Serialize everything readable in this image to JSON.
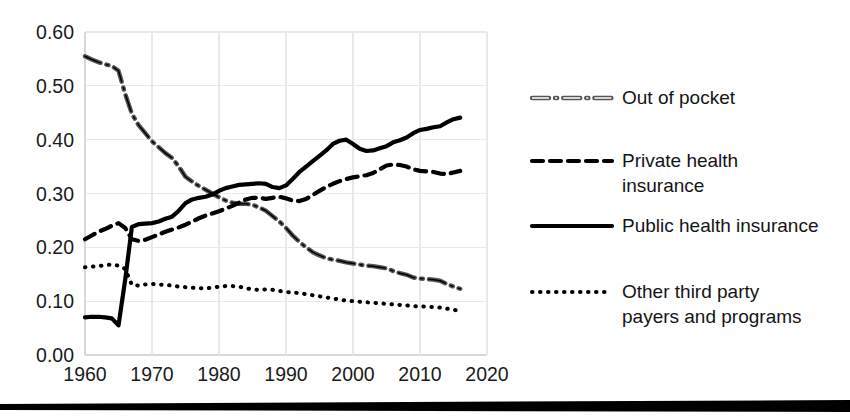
{
  "chart_data": {
    "type": "line",
    "title": "",
    "xlabel": "",
    "ylabel": "",
    "xlim": [
      1960,
      2020
    ],
    "ylim": [
      0.0,
      0.6
    ],
    "xticks": [
      1960,
      1970,
      1980,
      1990,
      2000,
      2010,
      2020
    ],
    "yticks": [
      0.0,
      0.1,
      0.2,
      0.3,
      0.4,
      0.5,
      0.6
    ],
    "xtick_labels": [
      "1960",
      "1970",
      "1980",
      "1990",
      "2000",
      "2010",
      "2020"
    ],
    "ytick_labels": [
      "0.00",
      "0.10",
      "0.20",
      "0.30",
      "0.40",
      "0.50",
      "0.60"
    ],
    "grid": true,
    "legend_position": "right",
    "x": [
      1960,
      1961,
      1962,
      1963,
      1964,
      1965,
      1966,
      1967,
      1968,
      1969,
      1970,
      1971,
      1972,
      1973,
      1974,
      1975,
      1976,
      1977,
      1978,
      1979,
      1980,
      1981,
      1982,
      1983,
      1984,
      1985,
      1986,
      1987,
      1988,
      1989,
      1990,
      1991,
      1992,
      1993,
      1994,
      1995,
      1996,
      1997,
      1998,
      1999,
      2000,
      2001,
      2002,
      2003,
      2004,
      2005,
      2006,
      2007,
      2008,
      2009,
      2010,
      2011,
      2012,
      2013,
      2014,
      2015,
      2016
    ],
    "series": [
      {
        "name": "Out of pocket",
        "style": "dashdot",
        "values": [
          0.555,
          0.549,
          0.544,
          0.54,
          0.537,
          0.528,
          0.485,
          0.448,
          0.427,
          0.412,
          0.397,
          0.386,
          0.375,
          0.366,
          0.35,
          0.331,
          0.322,
          0.314,
          0.307,
          0.3,
          0.293,
          0.287,
          0.283,
          0.281,
          0.281,
          0.279,
          0.274,
          0.268,
          0.258,
          0.248,
          0.236,
          0.222,
          0.21,
          0.2,
          0.191,
          0.185,
          0.18,
          0.177,
          0.175,
          0.172,
          0.17,
          0.168,
          0.166,
          0.165,
          0.163,
          0.161,
          0.156,
          0.152,
          0.149,
          0.144,
          0.142,
          0.141,
          0.14,
          0.138,
          0.132,
          0.127,
          0.123
        ]
      },
      {
        "name": "Private health insurance",
        "style": "dashed",
        "values": [
          0.215,
          0.222,
          0.229,
          0.234,
          0.24,
          0.245,
          0.236,
          0.215,
          0.212,
          0.214,
          0.219,
          0.224,
          0.229,
          0.233,
          0.237,
          0.242,
          0.248,
          0.254,
          0.259,
          0.263,
          0.267,
          0.272,
          0.277,
          0.283,
          0.289,
          0.292,
          0.292,
          0.29,
          0.292,
          0.294,
          0.291,
          0.287,
          0.286,
          0.29,
          0.297,
          0.305,
          0.312,
          0.318,
          0.323,
          0.327,
          0.33,
          0.332,
          0.334,
          0.338,
          0.345,
          0.352,
          0.354,
          0.353,
          0.35,
          0.345,
          0.342,
          0.341,
          0.34,
          0.337,
          0.336,
          0.339,
          0.342
        ]
      },
      {
        "name": "Public health insurance",
        "style": "solid",
        "values": [
          0.07,
          0.071,
          0.071,
          0.07,
          0.068,
          0.055,
          0.14,
          0.238,
          0.243,
          0.244,
          0.245,
          0.248,
          0.253,
          0.257,
          0.268,
          0.282,
          0.289,
          0.292,
          0.294,
          0.298,
          0.305,
          0.31,
          0.313,
          0.316,
          0.317,
          0.318,
          0.319,
          0.318,
          0.312,
          0.31,
          0.315,
          0.327,
          0.34,
          0.35,
          0.36,
          0.37,
          0.38,
          0.392,
          0.398,
          0.4,
          0.392,
          0.383,
          0.379,
          0.38,
          0.384,
          0.388,
          0.395,
          0.399,
          0.404,
          0.412,
          0.418,
          0.42,
          0.423,
          0.425,
          0.432,
          0.438,
          0.441
        ]
      },
      {
        "name": "Other third party payers and programs",
        "style": "dotted",
        "values": [
          0.163,
          0.164,
          0.165,
          0.167,
          0.168,
          0.166,
          0.16,
          0.13,
          0.129,
          0.131,
          0.132,
          0.131,
          0.13,
          0.129,
          0.127,
          0.126,
          0.125,
          0.124,
          0.124,
          0.125,
          0.127,
          0.128,
          0.128,
          0.127,
          0.124,
          0.122,
          0.121,
          0.122,
          0.121,
          0.119,
          0.117,
          0.116,
          0.115,
          0.113,
          0.111,
          0.109,
          0.107,
          0.105,
          0.103,
          0.101,
          0.1,
          0.099,
          0.098,
          0.097,
          0.096,
          0.095,
          0.094,
          0.093,
          0.092,
          0.091,
          0.09,
          0.09,
          0.089,
          0.088,
          0.086,
          0.084,
          0.082
        ]
      }
    ]
  },
  "legend": {
    "entries": [
      {
        "label_line1": "Out of pocket",
        "label_line2": "",
        "marker": "dashdot-line-marker"
      },
      {
        "label_line1": "Private health",
        "label_line2": "insurance",
        "marker": "dashed-line-marker"
      },
      {
        "label_line1": "Public health insurance",
        "label_line2": "",
        "marker": "solid-line-marker"
      },
      {
        "label_line1": "Other third party",
        "label_line2": "payers and programs",
        "marker": "dotted-line-marker"
      }
    ]
  },
  "colors": {
    "line": "#000000",
    "outline_line": "#555555",
    "grid": "#e9e9e9",
    "text": "#141414",
    "background": "#ffffff"
  }
}
